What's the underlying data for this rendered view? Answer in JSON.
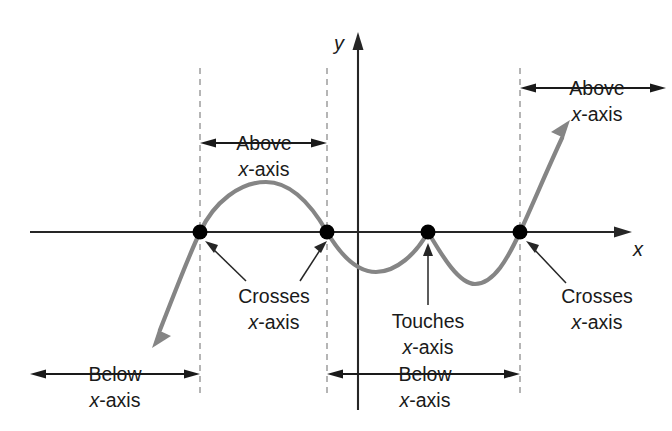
{
  "figure": {
    "axis_labels": {
      "x": "x",
      "y": "y"
    },
    "colors": {
      "curve": "#858585",
      "axis": "#262626",
      "dashed_guide": "#9d9d9d",
      "root_dot": "#000000",
      "text": "#1a1a1a",
      "background": "#ffffff"
    },
    "annotations": [
      {
        "id": "above-middle",
        "line1": "Above",
        "line2": "x-axis",
        "kind": "span",
        "direction": "both"
      },
      {
        "id": "above-right",
        "line1": "Above",
        "line2": "x-axis",
        "kind": "span",
        "direction": "both"
      },
      {
        "id": "crosses-left",
        "line1": "Crosses",
        "line2": "x-axis",
        "kind": "callout",
        "targets": 2
      },
      {
        "id": "touches-middle",
        "line1": "Touches",
        "line2": "x-axis",
        "kind": "callout",
        "targets": 1
      },
      {
        "id": "crosses-right",
        "line1": "Crosses",
        "line2": "x-axis",
        "kind": "callout",
        "targets": 1
      },
      {
        "id": "below-left",
        "line1": "Below",
        "line2": "x-axis",
        "kind": "span",
        "direction": "both"
      },
      {
        "id": "below-middle",
        "line1": "Below",
        "line2": "x-axis",
        "kind": "span",
        "direction": "both"
      }
    ]
  },
  "chart_data": {
    "type": "line",
    "xlabel": "x",
    "ylabel": "y",
    "grid": false,
    "legend": null,
    "axis_style": {
      "x_axis_pixel_y": 232,
      "y_axis_pixel_x": 358,
      "x_axis_arrow": "right",
      "y_axis_arrow": "up"
    },
    "roots": [
      {
        "index": 1,
        "px": 200,
        "behavior": "Crosses x-axis",
        "multiplicity": "odd",
        "guide_line": true
      },
      {
        "index": 2,
        "px": 327,
        "behavior": "Crosses x-axis",
        "multiplicity": "odd",
        "guide_line": true
      },
      {
        "index": 3,
        "px": 428,
        "behavior": "Touches x-axis",
        "multiplicity": "even",
        "guide_line": false
      },
      {
        "index": 4,
        "px": 520,
        "behavior": "Crosses x-axis",
        "multiplicity": "odd",
        "guide_line": true
      }
    ],
    "turning_points": [
      {
        "kind": "local-maximum",
        "px": 266,
        "py": 182,
        "position": "above x-axis"
      },
      {
        "kind": "local-minimum",
        "px": 376,
        "py": 272,
        "position": "below x-axis"
      },
      {
        "kind": "local-maximum",
        "px": 428,
        "py": 232,
        "position": "on x-axis"
      },
      {
        "kind": "local-minimum",
        "px": 475,
        "py": 284,
        "position": "below x-axis"
      }
    ],
    "intervals": [
      {
        "label": "Below x-axis",
        "from": "-infinity",
        "to": "root 1",
        "sign": "negative"
      },
      {
        "label": "Above x-axis",
        "from": "root 1",
        "to": "root 2",
        "sign": "positive"
      },
      {
        "label": "Below x-axis",
        "from": "root 2",
        "to": "root 4",
        "sign": "negative"
      },
      {
        "label": "Above x-axis",
        "from": "root 4",
        "to": "+infinity",
        "sign": "positive"
      }
    ],
    "end_behavior": {
      "left": "falls (arrow down-left, below x-axis)",
      "right": "rises (arrow up-right, above x-axis)"
    }
  }
}
